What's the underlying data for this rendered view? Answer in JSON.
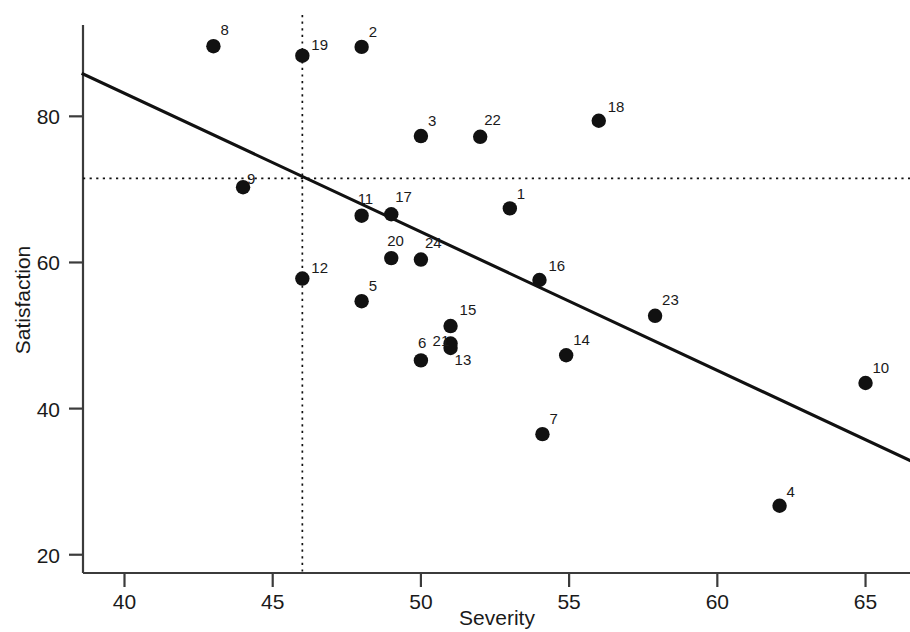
{
  "chart_data": {
    "type": "scatter",
    "title": "",
    "xlabel": "Severity",
    "ylabel": "Satisfaction",
    "xlim": [
      38.6,
      66.5
    ],
    "ylim": [
      17.5,
      92.5
    ],
    "xticks": [
      40,
      45,
      50,
      55,
      60,
      65
    ],
    "yticks": [
      20,
      40,
      60,
      80
    ],
    "xtick_labels": [
      "40",
      "45",
      "50",
      "55",
      "60",
      "65"
    ],
    "ytick_labels": [
      "20",
      "40",
      "60",
      "80"
    ],
    "grid": false,
    "legend": null,
    "point_labels_shown": true,
    "points": [
      {
        "label": "1",
        "x": 53.0,
        "y": 67.4
      },
      {
        "label": "2",
        "x": 48.0,
        "y": 89.5
      },
      {
        "label": "3",
        "x": 50.0,
        "y": 77.3
      },
      {
        "label": "4",
        "x": 62.1,
        "y": 26.7
      },
      {
        "label": "5",
        "x": 48.0,
        "y": 54.7
      },
      {
        "label": "6",
        "x": 50.0,
        "y": 46.6
      },
      {
        "label": "7",
        "x": 54.1,
        "y": 36.5
      },
      {
        "label": "8",
        "x": 43.0,
        "y": 89.6
      },
      {
        "label": "9",
        "x": 44.0,
        "y": 70.3
      },
      {
        "label": "10",
        "x": 65.0,
        "y": 43.5
      },
      {
        "label": "11",
        "x": 48.0,
        "y": 66.4
      },
      {
        "label": "12",
        "x": 46.0,
        "y": 57.8
      },
      {
        "label": "13",
        "x": 51.0,
        "y": 48.3
      },
      {
        "label": "14",
        "x": 54.9,
        "y": 47.3
      },
      {
        "label": "15",
        "x": 51.0,
        "y": 51.3
      },
      {
        "label": "16",
        "x": 54.0,
        "y": 57.6
      },
      {
        "label": "17",
        "x": 49.0,
        "y": 66.6
      },
      {
        "label": "18",
        "x": 56.0,
        "y": 79.4
      },
      {
        "label": "19",
        "x": 46.0,
        "y": 88.3
      },
      {
        "label": "20",
        "x": 49.0,
        "y": 60.6
      },
      {
        "label": "21",
        "x": 51.0,
        "y": 48.9
      },
      {
        "label": "22",
        "x": 52.0,
        "y": 77.2
      },
      {
        "label": "23",
        "x": 57.9,
        "y": 52.7
      },
      {
        "label": "24",
        "x": 50.0,
        "y": 60.4
      }
    ],
    "label_offsets": {
      "1": [
        7,
        -9
      ],
      "2": [
        7,
        -10
      ],
      "3": [
        7,
        -10
      ],
      "4": [
        7,
        -9
      ],
      "5": [
        7,
        -10
      ],
      "6": [
        -3,
        -12
      ],
      "7": [
        7,
        -10
      ],
      "8": [
        7,
        -11
      ],
      "9": [
        4,
        -3
      ],
      "10": [
        7,
        -10
      ],
      "11": [
        -4,
        -12
      ],
      "12": [
        9,
        -6
      ],
      "13": [
        4,
        17
      ],
      "14": [
        7,
        -10
      ],
      "15": [
        9,
        -11
      ],
      "16": [
        9,
        -9
      ],
      "17": [
        4,
        -12
      ],
      "18": [
        9,
        -9
      ],
      "19": [
        9,
        -6
      ],
      "20": [
        -4,
        -12
      ],
      "21": [
        -18,
        2
      ],
      "22": [
        4,
        -12
      ],
      "23": [
        7,
        -11
      ],
      "24": [
        4,
        -12
      ]
    },
    "regression_line": {
      "description": "least-squares fit line",
      "x_start": 38.6,
      "y_start": 85.8,
      "x_end": 66.5,
      "y_end": 32.9
    },
    "reference_lines": {
      "vertical_mean_x": 46.0,
      "horizontal_mean_y": 71.5,
      "style": "dotted"
    }
  },
  "axes": {
    "x_title": "Severity",
    "y_title": "Satisfaction"
  }
}
